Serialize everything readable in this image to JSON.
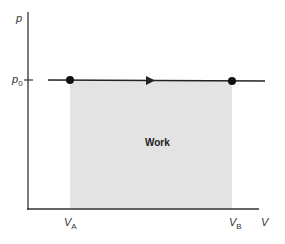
{
  "diagram": {
    "type": "pressure-volume diagram (isobaric process)",
    "y_axis_label": "p",
    "x_axis_label": "V",
    "pressure_label": {
      "base": "p",
      "sub": "0"
    },
    "volume_labels": [
      {
        "base": "V",
        "sub": "A"
      },
      {
        "base": "V",
        "sub": "B"
      }
    ],
    "area_label": "Work",
    "colors": {
      "axis": "#333333",
      "line": "#222222",
      "shaded_area": "#e3e3e3",
      "points": "#111111"
    }
  }
}
